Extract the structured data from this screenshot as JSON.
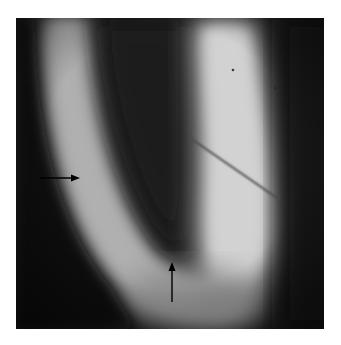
{
  "figure": {
    "type": "grayscale-fluorescence-micrograph",
    "colors": {
      "background": "#ffffff",
      "dark_field": "#151515",
      "bright_band": "#c8c8c8",
      "arrow": "#000000"
    },
    "annotations": [
      {
        "name": "arrow-right",
        "direction": "right",
        "from": [
          40,
          178
        ],
        "to": [
          80,
          178
        ]
      },
      {
        "name": "arrow-up",
        "direction": "up",
        "from": [
          172,
          302
        ],
        "to": [
          172,
          262
        ]
      }
    ],
    "features": [
      {
        "name": "scratch-line",
        "from": [
          190,
          138
        ],
        "to": [
          280,
          200
        ]
      },
      {
        "name": "dust-dot",
        "at": [
          233,
          70
        ]
      },
      {
        "name": "dust-dot",
        "at": [
          275,
          88
        ]
      }
    ]
  }
}
